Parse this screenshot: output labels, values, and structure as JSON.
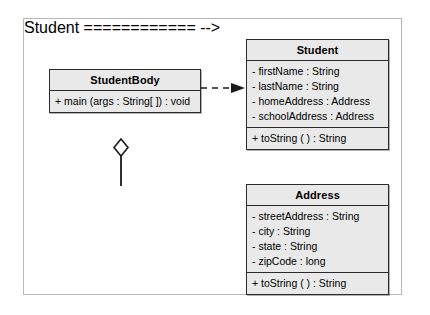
{
  "diagram": {
    "type": "uml-class-diagram",
    "background_color": "#ffffff",
    "frame_border_color": "#b8b8b8",
    "class_fill_color": "#e9e9e9",
    "class_border_color": "#2b2b2b",
    "classes": [
      {
        "id": "studentbody",
        "name": "StudentBody",
        "attributes": [],
        "methods": [
          "+ main (args : String[ ]) : void"
        ]
      },
      {
        "id": "student",
        "name": "Student",
        "attributes": [
          "- firstName : String",
          "- lastName : String",
          "- homeAddress : Address",
          "- schoolAddress : Address"
        ],
        "methods": [
          "+ toString ( ) : String"
        ]
      },
      {
        "id": "address",
        "name": "Address",
        "attributes": [
          "- streetAddress : String",
          "- city : String",
          "- state : String",
          "- zipCode : long",
          ""
        ],
        "methods": [
          "+ toString ( ) : String"
        ]
      }
    ],
    "relationships": [
      {
        "id": "dependency-studentbody-student",
        "kind": "dependency",
        "line_style": "dashed",
        "arrowhead": "filled-arrow",
        "from": "StudentBody",
        "to": "Student"
      },
      {
        "id": "aggregation-student-address",
        "kind": "aggregation",
        "line_style": "solid",
        "arrowhead": "hollow-diamond",
        "from": "Student",
        "to": "Address"
      }
    ]
  }
}
